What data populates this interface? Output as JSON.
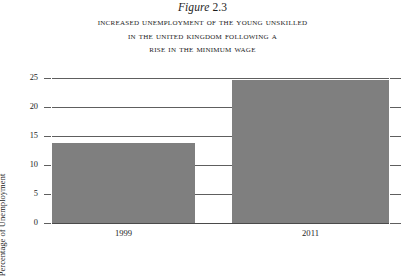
{
  "figure": {
    "number_prefix": "Figure",
    "number": "2.3",
    "title_lines": [
      "Increased Unemployment of the Young Unskilled",
      "in the United Kingdom Following a",
      "Rise in the Minimum Wage"
    ]
  },
  "chart_data": {
    "type": "bar",
    "title": "Increased Unemployment of the Young Unskilled in the United Kingdom Following a Rise in the Minimum Wage",
    "categories": [
      "1999",
      "2011"
    ],
    "values": [
      13.8,
      24.7
    ],
    "xlabel": "",
    "ylabel": "Percentage of Unemployment",
    "ylim": [
      0,
      25
    ],
    "yticks": [
      "0",
      "5",
      "10",
      "15",
      "20",
      "25"
    ],
    "ytick_values": [
      0,
      5,
      10,
      15,
      20,
      25
    ],
    "grid": true,
    "legend": false,
    "bar_color": "#7f7f7f",
    "axis_color": "#5e5e5e",
    "background": "#ffffff"
  }
}
